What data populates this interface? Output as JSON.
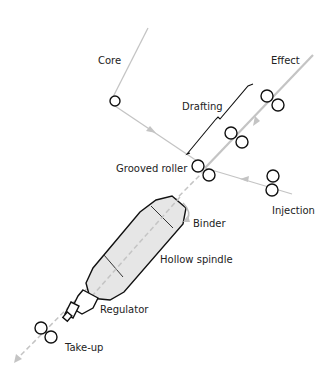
{
  "diagram": {
    "labels": {
      "core": "Core",
      "effect": "Effect",
      "drafting": "Drafting",
      "grooved_roller": "Grooved roller",
      "injection": "Injection",
      "binder": "Binder",
      "hollow_spindle": "Hollow spindle",
      "regulator": "Regulator",
      "take_up": "Take-up"
    },
    "colors": {
      "yarn_path": "#c4c4c4",
      "outline": "#111111",
      "spindle_fill": "#e6e6e6"
    }
  }
}
